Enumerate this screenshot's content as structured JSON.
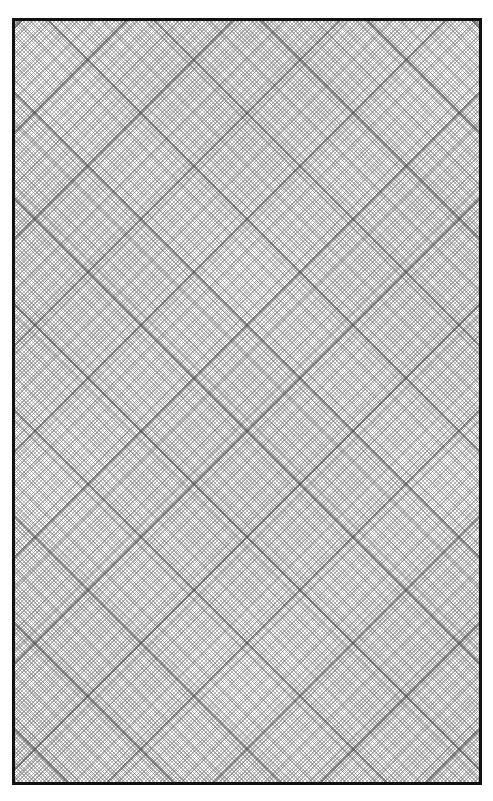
{
  "page": {
    "type": "diagonal graph paper",
    "background_color": "#ffffff",
    "border_color": "#111111",
    "line_color": "#787878",
    "major_line_color": "#464646",
    "grid_angle_degrees": 45,
    "major_intersection_spacing_px": 106,
    "label": ""
  }
}
